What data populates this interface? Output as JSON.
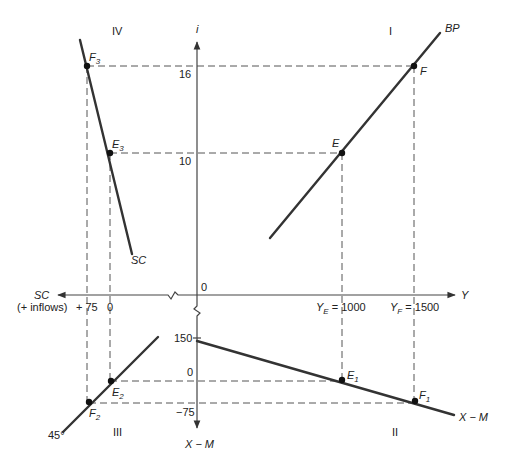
{
  "diagram": {
    "quadrants": {
      "I": "I",
      "II": "II",
      "III": "III",
      "IV": "IV"
    },
    "axes": {
      "vertical_top": "i",
      "vertical_bottom": "X − M",
      "horizontal_right": "Y",
      "horizontal_left": "SC",
      "horizontal_left_note": "(+ inflows)",
      "origin": "0"
    },
    "ticks": {
      "i_16": "16",
      "i_10": "10",
      "y_e": "Y",
      "y_e_sub": "E",
      "y_e_val": " = 1000",
      "y_f": "Y",
      "y_f_sub": "F",
      "y_f_val": " = 1500",
      "sc_75": "+ 75",
      "sc_0": "0",
      "xm_150": "150",
      "xm_0": "0",
      "xm_neg75": "−75"
    },
    "curves": {
      "bp": "BP",
      "sc": "SC",
      "xm": "X − M",
      "line45": "45°"
    },
    "points": {
      "E": "E",
      "F": "F",
      "E1": "E",
      "E1_sub": "1",
      "F1": "F",
      "F1_sub": "1",
      "E2": "E",
      "E2_sub": "2",
      "F2": "F",
      "F2_sub": "2",
      "E3": "E",
      "E3_sub": "3",
      "F3": "F",
      "F3_sub": "3"
    }
  }
}
